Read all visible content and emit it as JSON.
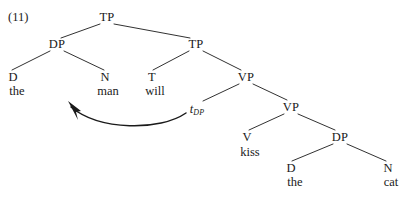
{
  "figure": {
    "example_number": "(11)",
    "caption_sentence": "the man will kiss the cat"
  },
  "colors": {
    "ink": "#1a1a1a",
    "background": "#ffffff",
    "line": "#1a1a1a"
  },
  "tree": {
    "nodes": {
      "root_tp": {
        "label": "TP",
        "x": 107,
        "y": 17
      },
      "subject_dp": {
        "label": "DP",
        "x": 57,
        "y": 44
      },
      "inner_tp": {
        "label": "TP",
        "x": 196,
        "y": 44
      },
      "det_the_subj": {
        "label": "D",
        "x": 13,
        "y": 77
      },
      "noun_man": {
        "label": "N",
        "x": 105,
        "y": 77
      },
      "tense_will": {
        "label": "T",
        "x": 152,
        "y": 77
      },
      "upper_vp": {
        "label": "VP",
        "x": 246,
        "y": 77
      },
      "trace_dp": {
        "label": "t",
        "subscript": "DP",
        "x": 197,
        "y": 109
      },
      "lower_vp": {
        "label": "VP",
        "x": 291,
        "y": 107
      },
      "verb_kiss": {
        "label": "V",
        "x": 247,
        "y": 137
      },
      "object_dp": {
        "label": "DP",
        "x": 340,
        "y": 137
      },
      "det_the_obj": {
        "label": "D",
        "x": 291,
        "y": 168
      },
      "noun_cat": {
        "label": "N",
        "x": 388,
        "y": 168
      }
    },
    "words": {
      "the_subject": {
        "text": "the",
        "x": 17,
        "y": 91
      },
      "man": {
        "text": "man",
        "x": 108,
        "y": 91
      },
      "will": {
        "text": "will",
        "x": 155,
        "y": 91
      },
      "kiss": {
        "text": "kiss",
        "x": 250,
        "y": 152
      },
      "the_object": {
        "text": "the",
        "x": 295,
        "y": 182
      },
      "cat": {
        "text": "cat",
        "x": 391,
        "y": 182
      }
    },
    "edges": [
      {
        "name": "root-tp-to-subject-dp",
        "x1": 100,
        "y1": 24,
        "x2": 61,
        "y2": 38
      },
      {
        "name": "root-tp-to-inner-tp",
        "x1": 114,
        "y1": 24,
        "x2": 190,
        "y2": 38
      },
      {
        "name": "subject-dp-to-d",
        "x1": 50,
        "y1": 51,
        "x2": 12,
        "y2": 70
      },
      {
        "name": "subject-dp-to-n",
        "x1": 64,
        "y1": 51,
        "x2": 104,
        "y2": 70
      },
      {
        "name": "inner-tp-to-t",
        "x1": 189,
        "y1": 51,
        "x2": 153,
        "y2": 70
      },
      {
        "name": "inner-tp-to-vp",
        "x1": 203,
        "y1": 51,
        "x2": 241,
        "y2": 70
      },
      {
        "name": "upper-vp-to-trace",
        "x1": 239,
        "y1": 84,
        "x2": 203,
        "y2": 101
      },
      {
        "name": "upper-vp-to-lower-vp",
        "x1": 253,
        "y1": 84,
        "x2": 287,
        "y2": 100
      },
      {
        "name": "lower-vp-to-v",
        "x1": 284,
        "y1": 114,
        "x2": 249,
        "y2": 130
      },
      {
        "name": "lower-vp-to-dp",
        "x1": 298,
        "y1": 114,
        "x2": 335,
        "y2": 130
      },
      {
        "name": "object-dp-to-d",
        "x1": 333,
        "y1": 144,
        "x2": 292,
        "y2": 161
      },
      {
        "name": "object-dp-to-n",
        "x1": 347,
        "y1": 144,
        "x2": 386,
        "y2": 161
      }
    ],
    "movement_arrow": {
      "name": "movement-arrow",
      "from_label": "t_DP",
      "to_label": "DP specifier of TP",
      "path": "M 186 113 C 160 131, 100 131, 71 107"
    }
  }
}
